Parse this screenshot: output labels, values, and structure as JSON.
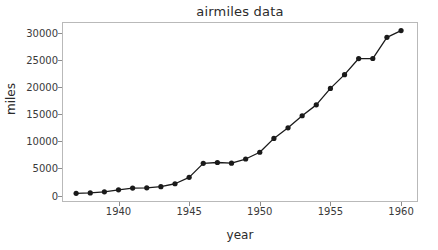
{
  "figure": {
    "background_color": "#ffffff",
    "frame_color": "#b9b9b9",
    "line_color": "#1a1a1a",
    "marker_color": "#1a1a1a",
    "text_color": "#2b2b2b"
  },
  "chart_data": {
    "type": "line",
    "title": "airmiles data",
    "xlabel": "year",
    "ylabel": "miles",
    "xlim": [
      1936.0,
      1961.2
    ],
    "ylim": [
      -1200,
      32100
    ],
    "grid": false,
    "legend": null,
    "markers": "filled-circle",
    "x": [
      1937,
      1938,
      1939,
      1940,
      1941,
      1942,
      1943,
      1944,
      1945,
      1946,
      1947,
      1948,
      1949,
      1950,
      1951,
      1952,
      1953,
      1954,
      1955,
      1956,
      1957,
      1958,
      1959,
      1960
    ],
    "values": [
      412,
      480,
      683,
      1052,
      1385,
      1418,
      1634,
      2178,
      3362,
      5948,
      6109,
      5981,
      6753,
      8003,
      10566,
      12528,
      14760,
      16769,
      19819,
      22362,
      25340,
      25343,
      29269,
      30514
    ],
    "xticks": [
      1940,
      1945,
      1950,
      1955,
      1960
    ],
    "xtick_labels": [
      "1940",
      "1945",
      "1950",
      "1955",
      "1960"
    ],
    "yticks": [
      0,
      5000,
      10000,
      15000,
      20000,
      25000,
      30000
    ],
    "ytick_labels": [
      "0",
      "5000",
      "10000",
      "15000",
      "20000",
      "25000",
      "30000"
    ]
  }
}
